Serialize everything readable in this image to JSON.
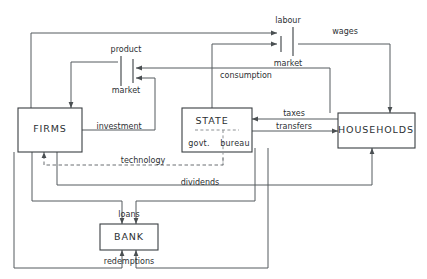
{
  "diagram": {
    "type": "circular-flow-economic-diagram",
    "background_color": "#ffffff",
    "line_color": "#555b5e",
    "box_border_color": "#3a3f42",
    "text_color": "#2c3033",
    "nodes": [
      {
        "id": "firms",
        "label": "FIRMS",
        "shape": "box"
      },
      {
        "id": "state",
        "label": "STATE",
        "shape": "box-divided"
      },
      {
        "id": "households",
        "label": "HOUSEHOLDS",
        "shape": "box"
      },
      {
        "id": "bank",
        "label": "BANK",
        "shape": "box"
      }
    ],
    "state_compartments": [
      {
        "id": "govt",
        "label": "govt."
      },
      {
        "id": "bureau",
        "label": "bureau"
      }
    ],
    "markets": [
      {
        "id": "labour-market",
        "line1": "labour",
        "line2": "market"
      },
      {
        "id": "product-market",
        "line1": "product",
        "line2": "market"
      }
    ],
    "flows": [
      {
        "id": "wages",
        "label": "wages"
      },
      {
        "id": "consumption",
        "label": "consumption"
      },
      {
        "id": "taxes",
        "label": "taxes"
      },
      {
        "id": "transfers",
        "label": "transfers"
      },
      {
        "id": "investment",
        "label": "investment"
      },
      {
        "id": "technology",
        "label": "technology",
        "style": "dashed"
      },
      {
        "id": "dividends",
        "label": "dividends"
      },
      {
        "id": "loans",
        "label": "loans"
      },
      {
        "id": "redemptions",
        "label": "redemptions"
      }
    ]
  }
}
